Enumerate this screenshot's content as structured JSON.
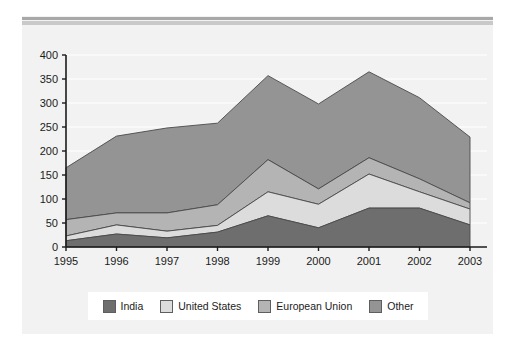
{
  "figure": {
    "background_color": "#f2f2f2",
    "page_color": "#ffffff",
    "rule_dark_color": "#a8a8a8",
    "rule_light_color": "#c9c9c9"
  },
  "chart_data": {
    "type": "area",
    "stacked": true,
    "title": "",
    "subtitle": "",
    "xlabel": "",
    "ylabel": "",
    "grid": true,
    "legend_position": "bottom",
    "xlim": [
      1995,
      2003
    ],
    "ylim": [
      0,
      400
    ],
    "ytick_step": 50,
    "categories": [
      "1995",
      "1996",
      "1997",
      "1998",
      "1999",
      "2000",
      "2001",
      "2002",
      "2003"
    ],
    "x": [
      1995,
      1996,
      1997,
      1998,
      1999,
      2000,
      2001,
      2002,
      2003
    ],
    "yticks": [
      0,
      50,
      100,
      150,
      200,
      250,
      300,
      350,
      400
    ],
    "ytick_labels": [
      "0",
      "50",
      "100",
      "150",
      "200",
      "250",
      "300",
      "350",
      "400"
    ],
    "series": [
      {
        "name": "India",
        "color": "#6e6e6e",
        "values": [
          13,
          27,
          19,
          31,
          65,
          40,
          81,
          81,
          46
        ]
      },
      {
        "name": "United States",
        "color": "#dcdcdc",
        "values": [
          10,
          19,
          14,
          14,
          50,
          49,
          71,
          34,
          33
        ]
      },
      {
        "name": "European Union",
        "color": "#b4b4b4",
        "values": [
          34,
          25,
          38,
          43,
          67,
          32,
          34,
          27,
          13
        ]
      },
      {
        "name": "Other",
        "color": "#949494",
        "values": [
          108,
          160,
          177,
          170,
          175,
          177,
          179,
          169,
          137
        ]
      }
    ],
    "cumulative_tops": {
      "India": [
        13,
        27,
        19,
        31,
        65,
        40,
        81,
        81,
        46
      ],
      "United States": [
        23,
        46,
        33,
        45,
        115,
        89,
        152,
        115,
        79
      ],
      "European Union": [
        57,
        71,
        71,
        88,
        182,
        121,
        186,
        142,
        92
      ],
      "Other": [
        165,
        231,
        248,
        258,
        357,
        298,
        365,
        311,
        229
      ]
    }
  },
  "legend": {
    "items": [
      {
        "label": "India",
        "color": "#6e6e6e"
      },
      {
        "label": "United States",
        "color": "#dcdcdc"
      },
      {
        "label": "European Union",
        "color": "#b4b4b4"
      },
      {
        "label": "Other",
        "color": "#949494"
      }
    ]
  }
}
